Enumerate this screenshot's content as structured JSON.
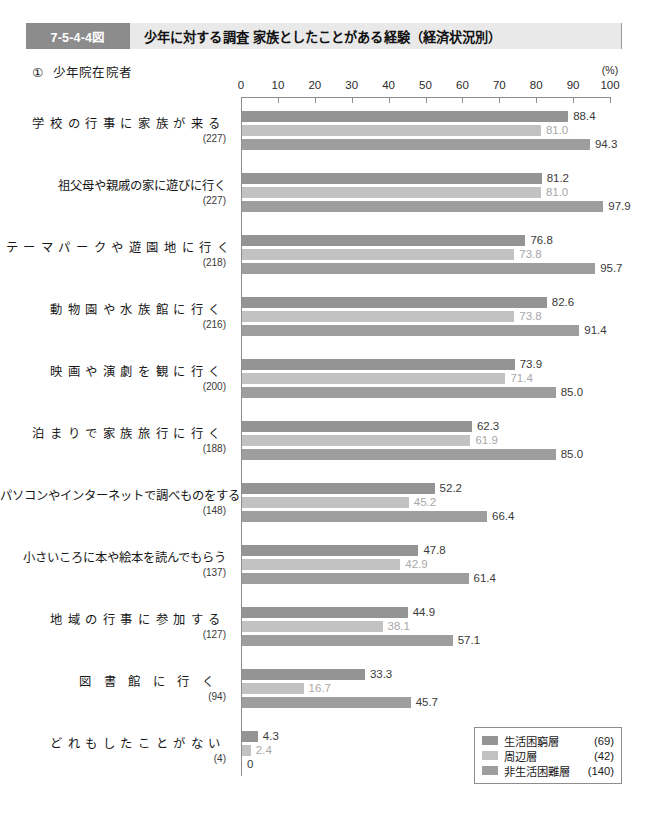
{
  "header": {
    "figure_number": "7-5-4-4図",
    "title": "少年に対する調査 家族としたことがある経験（経済状況別）"
  },
  "subtitle": {
    "marker": "①",
    "text": "少年院在院者"
  },
  "chart_data": {
    "type": "bar",
    "orientation": "horizontal",
    "title": "少年に対する調査 家族としたことがある経験（経済状況別）",
    "subtitle": "① 少年院在院者",
    "xlabel": "(%)",
    "ylabel": "",
    "xlim": [
      0,
      100
    ],
    "xticks": [
      0,
      10,
      20,
      30,
      40,
      50,
      60,
      70,
      80,
      90,
      100
    ],
    "unit_label": "(%)",
    "grid": false,
    "legend_position": "bottom-right",
    "series": [
      {
        "name": "生活困窮層",
        "count": "(69)",
        "color": "#949494",
        "values": [
          88.4,
          81.2,
          76.8,
          82.6,
          73.9,
          62.3,
          52.2,
          47.8,
          44.9,
          33.3,
          4.3
        ]
      },
      {
        "name": "周辺層",
        "count": "(42)",
        "color": "#c2c2c2",
        "values": [
          81.0,
          81.0,
          73.8,
          73.8,
          71.4,
          61.9,
          45.2,
          42.9,
          38.1,
          16.7,
          2.4
        ]
      },
      {
        "name": "非生活困難層",
        "count": "(140)",
        "color": "#9e9e9e",
        "values": [
          94.3,
          97.9,
          95.7,
          91.4,
          85.0,
          85.0,
          66.4,
          61.4,
          57.1,
          45.7,
          0
        ]
      }
    ],
    "categories": [
      {
        "label": "学校の行事に家族が来る",
        "count": "(227)",
        "spacing": "spread"
      },
      {
        "label": "祖父母や親戚の家に遊びに行く",
        "count": "(227)",
        "spacing": "none"
      },
      {
        "label": "テーマパークや遊園地に行く",
        "count": "(218)",
        "spacing": "spread"
      },
      {
        "label": "動物園や水族館に行く",
        "count": "(216)",
        "spacing": "spread"
      },
      {
        "label": "映画や演劇を観に行く",
        "count": "(200)",
        "spacing": "spread"
      },
      {
        "label": "泊まりで家族旅行に行く",
        "count": "(188)",
        "spacing": "spread"
      },
      {
        "label": "パソコンやインターネットで調べものをする",
        "count": "(148)",
        "spacing": "none"
      },
      {
        "label": "小さいころに本や絵本を読んでもらう",
        "count": "(137)",
        "spacing": "none"
      },
      {
        "label": "地域の行事に参加する",
        "count": "(127)",
        "spacing": "spread"
      },
      {
        "label": "図書館に行く",
        "count": "(94)",
        "spacing": "spread-wide"
      },
      {
        "label": "どれもしたことがない",
        "count": "(4)",
        "spacing": "spread"
      }
    ],
    "value_labels": [
      [
        "88.4",
        "81.0",
        "94.3"
      ],
      [
        "81.2",
        "81.0",
        "97.9"
      ],
      [
        "76.8",
        "73.8",
        "95.7"
      ],
      [
        "82.6",
        "73.8",
        "91.4"
      ],
      [
        "73.9",
        "71.4",
        "85.0"
      ],
      [
        "62.3",
        "61.9",
        "85.0"
      ],
      [
        "52.2",
        "45.2",
        "66.4"
      ],
      [
        "47.8",
        "42.9",
        "61.4"
      ],
      [
        "44.9",
        "38.1",
        "57.1"
      ],
      [
        "33.3",
        "16.7",
        "45.7"
      ],
      [
        "4.3",
        "2.4",
        "0"
      ]
    ]
  },
  "legend": {
    "items": [
      {
        "name": "生活困窮層",
        "count": "(69)"
      },
      {
        "name": "周辺層",
        "count": "(42)"
      },
      {
        "name": "非生活困難層",
        "count": "(140)"
      }
    ]
  },
  "colors": {
    "series_0": "#949494",
    "series_1": "#c2c2c2",
    "series_2": "#9e9e9e",
    "tag_background": "#8c8c8c",
    "header_background": "#e9e9e9",
    "axis": "#8d8d8d"
  }
}
